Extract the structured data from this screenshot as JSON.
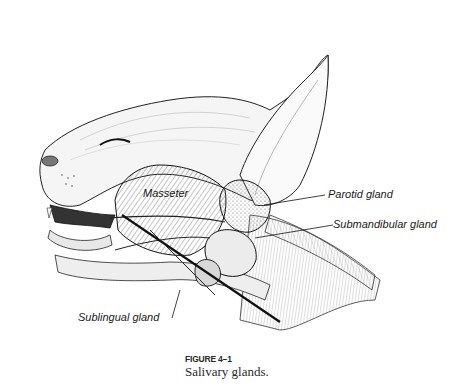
{
  "figure": {
    "number": "FIGURE 4–1",
    "caption": "Salivary glands.",
    "labels": [
      {
        "id": "masseter",
        "text": "Masseter"
      },
      {
        "id": "parotid",
        "text": "Parotid gland"
      },
      {
        "id": "submandibular",
        "text": "Submandibular gland"
      },
      {
        "id": "sublingual",
        "text": "Sublingual gland"
      }
    ]
  }
}
